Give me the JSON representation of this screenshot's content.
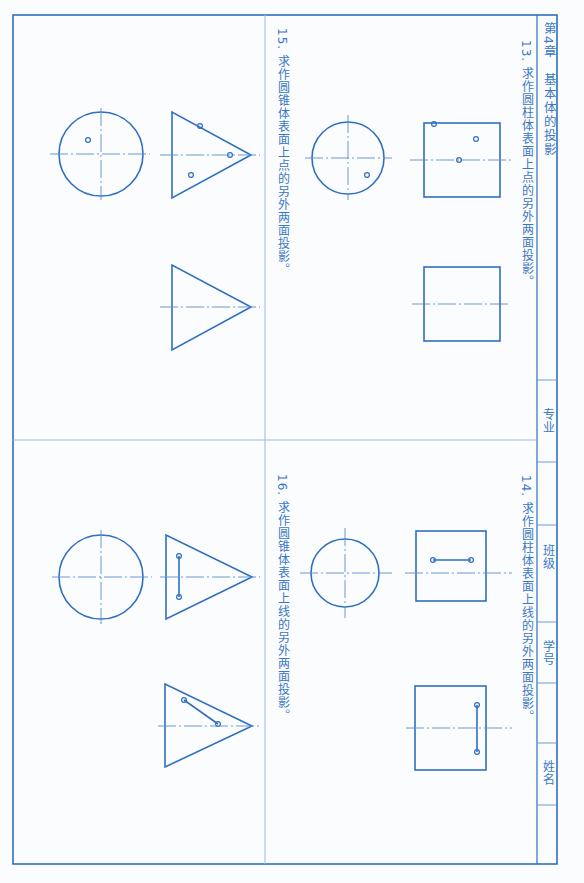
{
  "header": {
    "chapter": "第4章　基本体的投影",
    "fields": [
      {
        "label": "专业"
      },
      {
        "label": "班级"
      },
      {
        "label": "学号"
      },
      {
        "label": "姓名"
      }
    ]
  },
  "problems": [
    {
      "number": "13",
      "title": "13. 求作圆柱体表面上点的另外两面投影。",
      "points": [
        "a",
        "b'",
        "(c')",
        "a'"
      ]
    },
    {
      "number": "14",
      "title": "14. 求作圆柱体表面上线的另外两面投影。",
      "points": [
        "a'",
        "b'",
        "c\"",
        "d\""
      ]
    },
    {
      "number": "15",
      "title": "15. 求作圆锥体表面上点的另外两面投影。",
      "points": [
        "(a)",
        "a'",
        "b'",
        "(c')"
      ]
    },
    {
      "number": "16",
      "title": "16. 求作圆锥体表面上线的另外两面投影。",
      "points": [
        "a'",
        "b'",
        "c\"",
        "d\""
      ]
    }
  ],
  "colors": {
    "line": "#2f6fc0",
    "center": "#5a8fd0",
    "text": "#3a78c4",
    "paper": "#fbfcfd"
  }
}
